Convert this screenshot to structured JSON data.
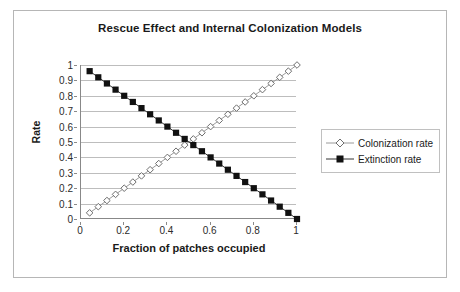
{
  "chart_data": {
    "type": "line",
    "title": "Rescue Effect and Internal Colonization Models",
    "xlabel": "Fraction of patches occupied",
    "ylabel": "Rate",
    "xlim": [
      0,
      1
    ],
    "ylim": [
      0,
      1
    ],
    "grid": "horizontal",
    "legend_position": "right",
    "x_ticks": [
      "0",
      "0.2",
      "0.4",
      "0.6",
      "0.8",
      "1"
    ],
    "x_tick_values": [
      0,
      0.2,
      0.4,
      0.6,
      0.8,
      1
    ],
    "y_ticks": [
      "0",
      "0.1",
      "0.2",
      "0.3",
      "0.4",
      "0.5",
      "0.6",
      "0.7",
      "0.8",
      "0.9",
      "1"
    ],
    "y_tick_values": [
      0,
      0.1,
      0.2,
      0.3,
      0.4,
      0.5,
      0.6,
      0.7,
      0.8,
      0.9,
      1
    ],
    "x": [
      0.04,
      0.08,
      0.12,
      0.16,
      0.2,
      0.24,
      0.28,
      0.32,
      0.36,
      0.4,
      0.44,
      0.48,
      0.52,
      0.56,
      0.6,
      0.64,
      0.68,
      0.72,
      0.76,
      0.8,
      0.84,
      0.88,
      0.92,
      0.96,
      1.0
    ],
    "series": [
      {
        "name": "Colonization rate",
        "marker": "open-diamond",
        "color": "#8c8c8c",
        "values": [
          0.04,
          0.08,
          0.12,
          0.16,
          0.2,
          0.24,
          0.28,
          0.32,
          0.36,
          0.4,
          0.44,
          0.48,
          0.52,
          0.56,
          0.6,
          0.64,
          0.68,
          0.72,
          0.76,
          0.8,
          0.84,
          0.88,
          0.92,
          0.96,
          1.0
        ]
      },
      {
        "name": "Extinction rate",
        "marker": "filled-square",
        "color": "#111111",
        "values": [
          0.96,
          0.92,
          0.88,
          0.84,
          0.8,
          0.76,
          0.72,
          0.68,
          0.64,
          0.6,
          0.56,
          0.52,
          0.48,
          0.44,
          0.4,
          0.36,
          0.32,
          0.28,
          0.24,
          0.2,
          0.16,
          0.12,
          0.08,
          0.04,
          0.0
        ]
      }
    ]
  },
  "legend": {
    "items": [
      {
        "label": "Colonization rate"
      },
      {
        "label": "Extinction rate"
      }
    ]
  }
}
